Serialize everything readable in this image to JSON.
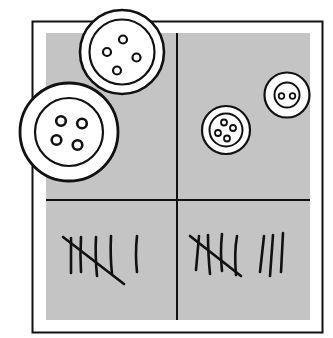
{
  "title": "Button and tally counting chart",
  "colors": {
    "background": "#ffffff",
    "panel": "#c4c4c4",
    "ink": "#111111",
    "button_fill": "#ffffff"
  },
  "grid": {
    "rows": 2,
    "columns": 2
  },
  "cells": [
    {
      "position": "top-left",
      "content": "buttons",
      "button_count": 2,
      "holes_per_button": [
        4,
        4
      ]
    },
    {
      "position": "top-right",
      "content": "buttons",
      "button_count": 2,
      "holes_per_button": [
        4,
        2
      ]
    },
    {
      "position": "bottom-left",
      "content": "tally",
      "tally_count": 6,
      "tally_label": "6"
    },
    {
      "position": "bottom-right",
      "content": "tally",
      "tally_count": 8,
      "tally_label": "8"
    }
  ]
}
